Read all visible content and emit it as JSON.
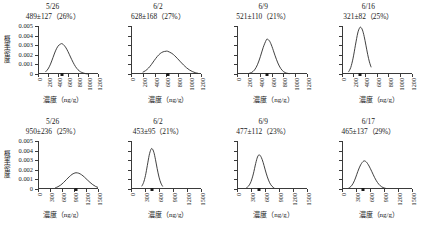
{
  "figure": {
    "axis_labels": {
      "y": "概率密度",
      "y_chars": [
        "概",
        "率",
        "密",
        "度"
      ],
      "x": "濃度（ng/g）"
    },
    "y_ticks": [
      "0",
      "0.001",
      "0.002",
      "0.003",
      "0.004",
      "0.005"
    ],
    "y_tick_values": [
      0,
      0.001,
      0.002,
      0.003,
      0.004,
      0.005
    ],
    "ylim": [
      0,
      0.005
    ],
    "mean_marker_name": "mean-marker"
  },
  "chart_data": [
    {
      "type": "line",
      "panel_index": 0,
      "title": "5/26",
      "annotation": "489±127（26%）",
      "mean": 489,
      "sd": 127,
      "cv_percent": 26,
      "xlabel": "濃度（ng/g）",
      "ylabel": "概率密度",
      "xlim": [
        0,
        1200
      ],
      "ylim": [
        0,
        0.005
      ],
      "x_ticks": [
        "0",
        "200",
        "400",
        "600",
        "800",
        "1000",
        "1200"
      ],
      "x_tick_values": [
        0,
        200,
        400,
        600,
        800,
        1000,
        1200
      ],
      "peak_density": 0.00314,
      "grid": false,
      "legend": "none",
      "x": [
        150,
        200,
        250,
        300,
        350,
        400,
        450,
        489,
        550,
        600,
        650,
        700,
        750,
        800,
        850,
        900,
        950,
        1000
      ],
      "y": [
        0.00022,
        0.00052,
        0.00103,
        0.00172,
        0.00241,
        0.0029,
        0.00312,
        0.00314,
        0.0028,
        0.00233,
        0.00177,
        0.00123,
        0.00077,
        0.00044,
        0.00023,
        0.00011,
        4e-05,
        1e-05
      ]
    },
    {
      "type": "line",
      "panel_index": 1,
      "title": "6/2",
      "annotation": "628±168（27%）",
      "mean": 628,
      "sd": 168,
      "cv_percent": 27,
      "xlabel": "濃度（ng/g）",
      "ylabel": "概率密度",
      "xlim": [
        0,
        1200
      ],
      "ylim": [
        0,
        0.005
      ],
      "x_ticks": [
        "0",
        "200",
        "400",
        "600",
        "800",
        "1000",
        "1200"
      ],
      "x_tick_values": [
        0,
        200,
        400,
        600,
        800,
        1000,
        1200
      ],
      "peak_density": 0.00237,
      "grid": false,
      "legend": "none",
      "x": [
        200,
        250,
        300,
        350,
        400,
        450,
        500,
        550,
        600,
        628,
        700,
        750,
        800,
        850,
        900,
        950,
        1000,
        1050,
        1100,
        1150
      ],
      "y": [
        0.00018,
        0.00035,
        0.00062,
        0.00099,
        0.00142,
        0.00182,
        0.00213,
        0.00231,
        0.00237,
        0.00237,
        0.00215,
        0.0019,
        0.00159,
        0.00126,
        0.00094,
        0.00066,
        0.00043,
        0.00026,
        0.00014,
        7e-05
      ]
    },
    {
      "type": "line",
      "panel_index": 2,
      "title": "6/9",
      "annotation": "521±110（21%）",
      "mean": 521,
      "sd": 110,
      "cv_percent": 21,
      "xlabel": "濃度（ng/g）",
      "ylabel": "概率密度",
      "xlim": [
        0,
        1200
      ],
      "ylim": [
        0,
        0.005
      ],
      "x_ticks": [
        "0",
        "200",
        "400",
        "600",
        "800",
        "1000",
        "1200"
      ],
      "x_tick_values": [
        0,
        200,
        400,
        600,
        800,
        1000,
        1200
      ],
      "peak_density": 0.00363,
      "grid": false,
      "legend": "none",
      "x": [
        200,
        250,
        300,
        350,
        400,
        450,
        500,
        521,
        560,
        600,
        650,
        700,
        750,
        800,
        850,
        900
      ],
      "y": [
        5e-05,
        0.00016,
        0.00042,
        0.00096,
        0.0018,
        0.00278,
        0.00352,
        0.00363,
        0.00341,
        0.00285,
        0.00196,
        0.00115,
        0.00057,
        0.00024,
        9e-05,
        3e-05
      ]
    },
    {
      "type": "line",
      "panel_index": 3,
      "title": "6/16",
      "annotation": "321±82（25%）",
      "mean": 321,
      "sd": 82,
      "cv_percent": 25,
      "xlabel": "濃度（ng/g）",
      "ylabel": "概率密度",
      "xlim": [
        0,
        1200
      ],
      "ylim": [
        0,
        0.005
      ],
      "x_ticks": [
        "0",
        "200",
        "400",
        "600",
        "800",
        "1000",
        "1200"
      ],
      "x_tick_values": [
        0,
        200,
        400,
        600,
        800,
        1000,
        1200
      ],
      "peak_density": 0.00487,
      "grid": false,
      "legend": "none",
      "x": [
        110,
        150,
        190,
        230,
        270,
        300,
        321,
        350,
        380,
        410,
        440,
        470,
        500
      ],
      "y": [
        0.0002,
        0.00068,
        0.00165,
        0.003,
        0.00427,
        0.00478,
        0.00487,
        0.00459,
        0.00392,
        0.003,
        0.00205,
        0.00126,
        0.0007
      ]
    },
    {
      "type": "line",
      "panel_index": 4,
      "title": "5/26",
      "annotation": "950±236（25%）",
      "mean": 950,
      "sd": 236,
      "cv_percent": 25,
      "xlabel": "濃度（ng/g）",
      "ylabel": "概率密度",
      "xlim": [
        0,
        1500
      ],
      "ylim": [
        0,
        0.005
      ],
      "x_ticks": [
        "0",
        "300",
        "600",
        "900",
        "1200",
        "1500"
      ],
      "x_tick_values": [
        0,
        300,
        600,
        900,
        1200,
        1500
      ],
      "peak_density": 0.00169,
      "grid": false,
      "legend": "none",
      "x": [
        430,
        500,
        570,
        640,
        710,
        780,
        850,
        900,
        950,
        1020,
        1090,
        1160,
        1230,
        1300,
        1370,
        1440,
        1500
      ],
      "y": [
        0.00012,
        0.00024,
        0.00042,
        0.00068,
        0.00098,
        0.00127,
        0.00152,
        0.00163,
        0.00169,
        0.00164,
        0.00148,
        0.00124,
        0.00096,
        0.00069,
        0.00045,
        0.00027,
        0.00016
      ]
    },
    {
      "type": "line",
      "panel_index": 5,
      "title": "6/2",
      "annotation": "453±95（21%）",
      "mean": 453,
      "sd": 95,
      "cv_percent": 21,
      "xlabel": "濃度（ng/g）",
      "ylabel": "概率密度",
      "xlim": [
        0,
        1500
      ],
      "ylim": [
        0,
        0.005
      ],
      "x_ticks": [
        "0",
        "300",
        "600",
        "900",
        "1200",
        "1500"
      ],
      "x_tick_values": [
        0,
        300,
        600,
        900,
        1200,
        1500
      ],
      "peak_density": 0.0042,
      "grid": false,
      "legend": "none",
      "x": [
        230,
        270,
        310,
        350,
        390,
        425,
        453,
        490,
        525,
        560,
        600,
        640,
        680
      ],
      "y": [
        0.00028,
        0.00068,
        0.0014,
        0.00245,
        0.00352,
        0.0041,
        0.0042,
        0.00382,
        0.00305,
        0.00215,
        0.00124,
        0.00062,
        0.00026
      ]
    },
    {
      "type": "line",
      "panel_index": 6,
      "title": "6/9",
      "annotation": "477±112（23%）",
      "mean": 477,
      "sd": 112,
      "cv_percent": 23,
      "xlabel": "濃度（ng/g）",
      "ylabel": "概率密度",
      "xlim": [
        0,
        1500
      ],
      "ylim": [
        0,
        0.005
      ],
      "x_ticks": [
        "0",
        "300",
        "600",
        "900",
        "1200",
        "1500"
      ],
      "x_tick_values": [
        0,
        300,
        600,
        900,
        1200,
        1500
      ],
      "peak_density": 0.00356,
      "grid": false,
      "legend": "none",
      "x": [
        200,
        250,
        300,
        350,
        400,
        440,
        477,
        520,
        560,
        600,
        650,
        700,
        750,
        800
      ],
      "y": [
        0.00012,
        0.00032,
        0.00077,
        0.00157,
        0.00265,
        0.00334,
        0.00356,
        0.0033,
        0.00277,
        0.00207,
        0.00126,
        0.00065,
        0.00028,
        0.0001
      ]
    },
    {
      "type": "line",
      "panel_index": 7,
      "title": "6/17",
      "annotation": "465±137（29%）",
      "mean": 465,
      "sd": 137,
      "cv_percent": 29,
      "xlabel": "濃度（ng/g）",
      "ylabel": "概率密度",
      "xlim": [
        0,
        1500
      ],
      "ylim": [
        0,
        0.005
      ],
      "x_ticks": [
        "0",
        "300",
        "600",
        "900",
        "1200",
        "1500"
      ],
      "x_tick_values": [
        0,
        300,
        600,
        900,
        1200,
        1500
      ],
      "peak_density": 0.00291,
      "grid": false,
      "legend": "none",
      "x": [
        140,
        190,
        240,
        290,
        340,
        400,
        465,
        520,
        580,
        640,
        700,
        760,
        820,
        880,
        940
      ],
      "y": [
        9e-05,
        0.00026,
        0.0006,
        0.00115,
        0.00184,
        0.00252,
        0.00291,
        0.00282,
        0.00239,
        0.0018,
        0.00118,
        0.00068,
        0.00034,
        0.00015,
        6e-05
      ]
    }
  ]
}
